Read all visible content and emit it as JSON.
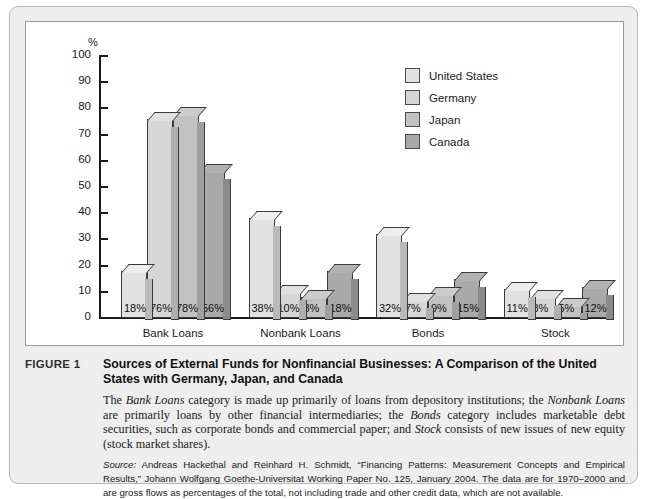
{
  "chart_data": {
    "type": "bar",
    "title": "",
    "xlabel": "",
    "ylabel": "%",
    "ylim": [
      0,
      100
    ],
    "ytick_step": 10,
    "yticks": [
      100,
      90,
      80,
      70,
      60,
      50,
      40,
      30,
      20,
      10,
      0
    ],
    "grid": false,
    "legend_position": "top-right",
    "categories": [
      "Bank Loans",
      "Nonbank Loans",
      "Bonds",
      "Stock"
    ],
    "series": [
      {
        "name": "United States",
        "values": [
          18,
          38,
          32,
          11
        ],
        "labels": [
          "18%",
          "38%",
          "32%",
          "11%"
        ],
        "color": "#e2e2e2"
      },
      {
        "name": "Germany",
        "values": [
          76,
          10,
          7,
          8
        ],
        "labels": [
          "76%",
          "10%",
          "7%",
          "8%"
        ],
        "color": "#d6d6d6"
      },
      {
        "name": "Japan",
        "values": [
          78,
          8,
          9,
          5
        ],
        "labels": [
          "78%",
          "8%",
          "9%",
          "5%"
        ],
        "color": "#c2c2c2"
      },
      {
        "name": "Canada",
        "values": [
          56,
          18,
          15,
          12
        ],
        "labels": [
          "56%",
          "18%",
          "15%",
          "12%"
        ],
        "color": "#a9a9a9"
      }
    ]
  },
  "axis": {
    "percent_symbol": "%"
  },
  "legend": {
    "items": [
      {
        "label": "United States",
        "color": "#e2e2e2"
      },
      {
        "label": "Germany",
        "color": "#d6d6d6"
      },
      {
        "label": "Japan",
        "color": "#c2c2c2"
      },
      {
        "label": "Canada",
        "color": "#a9a9a9"
      }
    ]
  },
  "caption": {
    "figure_number": "FIGURE 1",
    "title": "Sources of External Funds for Nonfinancial Businesses: A Comparison of the United States with Germany, Japan, and Canada",
    "body_parts": [
      {
        "text": "The ",
        "italic": false
      },
      {
        "text": "Bank Loans",
        "italic": true
      },
      {
        "text": " category is made up primarily of loans from depository institutions; the ",
        "italic": false
      },
      {
        "text": "Nonbank Loans",
        "italic": true
      },
      {
        "text": " are primarily loans by other financial intermediaries; the ",
        "italic": false
      },
      {
        "text": "Bonds",
        "italic": true
      },
      {
        "text": " category includes marketable debt securities, such as corporate bonds and commercial paper; and ",
        "italic": false
      },
      {
        "text": "Stock",
        "italic": true
      },
      {
        "text": " consists of new issues of new equity (stock market shares).",
        "italic": false
      }
    ],
    "source_label": "Source:",
    "source_text": " Andreas Hackethal and Reinhard H. Schmidt, “Financing Patterns: Measurement Concepts and Empirical Results,” Johann Wolfgang Goethe-Universitat Working Paper No. 125, January 2004. The data are for 1970–2000 and are gross flows as percentages of the total, not including trade and other credit data, which are not available."
  }
}
